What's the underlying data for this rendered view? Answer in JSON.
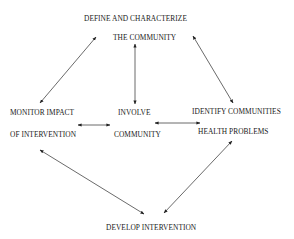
{
  "diagram": {
    "type": "cycle",
    "nodes": {
      "define": {
        "line1": "DEFINE AND CHARACTERIZE",
        "line2": "THE COMMUNITY"
      },
      "monitor": {
        "line1": "MONITOR IMPACT",
        "line2": "OF INTERVENTION"
      },
      "involve": {
        "line1": "INVOLVE",
        "line2": "COMMUNITY"
      },
      "identify": {
        "line1": "IDENTIFY COMMUNITIES",
        "line2": "HEALTH PROBLEMS"
      },
      "develop": {
        "line1": "DEVELOP INTERVENTION"
      }
    },
    "edges": [
      {
        "from": "define",
        "to": "monitor",
        "bidirectional": true
      },
      {
        "from": "define",
        "to": "involve",
        "bidirectional": true
      },
      {
        "from": "define",
        "to": "identify",
        "bidirectional": true
      },
      {
        "from": "monitor",
        "to": "involve",
        "bidirectional": true
      },
      {
        "from": "involve",
        "to": "identify",
        "bidirectional": true
      },
      {
        "from": "monitor",
        "to": "develop",
        "bidirectional": true
      },
      {
        "from": "identify",
        "to": "develop",
        "bidirectional": true
      }
    ],
    "colors": {
      "text": "#1a1a1a",
      "arrow": "#333333",
      "background": "#ffffff"
    }
  }
}
